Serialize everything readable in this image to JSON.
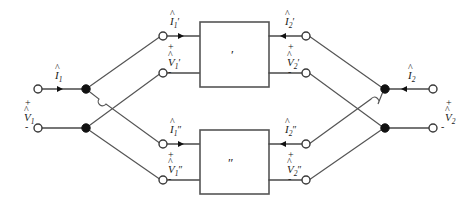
{
  "diagram": {
    "type": "circuit-schematic",
    "stroke_color": "#4a4a4a",
    "node_color": "#111111",
    "background": "#ffffff"
  },
  "boxes": [
    {
      "id": "network-prime",
      "mark": "′",
      "label": "two-port network prime"
    },
    {
      "id": "network-double-prime",
      "mark": "″",
      "label": "two-port network double prime"
    }
  ],
  "labels": {
    "input_current": {
      "hat": "^",
      "base": "I",
      "sub": "1",
      "prime": ""
    },
    "input_voltage": {
      "hat": "^",
      "base": "V",
      "sub": "1",
      "prime": ""
    },
    "output_current": {
      "hat": "^",
      "base": "I",
      "sub": "2",
      "prime": ""
    },
    "output_voltage": {
      "hat": "^",
      "base": "V",
      "sub": "2",
      "prime": ""
    },
    "top_in_current": {
      "hat": "^",
      "base": "I",
      "sub": "1",
      "prime": "′"
    },
    "top_in_voltage": {
      "hat": "^",
      "base": "V",
      "sub": "1",
      "prime": "′"
    },
    "top_out_current": {
      "hat": "^",
      "base": "I",
      "sub": "2",
      "prime": "′"
    },
    "top_out_voltage": {
      "hat": "^",
      "base": "V",
      "sub": "2",
      "prime": "′"
    },
    "bot_in_current": {
      "hat": "^",
      "base": "I",
      "sub": "1",
      "prime": "″"
    },
    "bot_in_voltage": {
      "hat": "^",
      "base": "V",
      "sub": "1",
      "prime": "″"
    },
    "bot_out_current": {
      "hat": "^",
      "base": "I",
      "sub": "2",
      "prime": "″"
    },
    "bot_out_voltage": {
      "hat": "^",
      "base": "V",
      "sub": "2",
      "prime": "″"
    }
  },
  "polarity": {
    "plus": "+",
    "minus": "-"
  }
}
